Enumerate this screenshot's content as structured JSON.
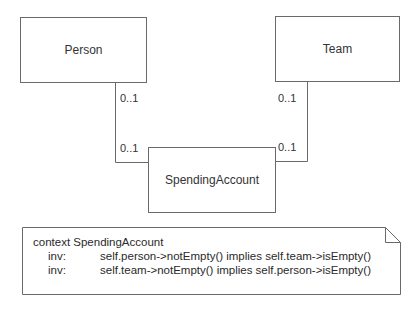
{
  "diagram": {
    "type": "UML class diagram with OCL constraint note",
    "classes": [
      {
        "id": "person",
        "name": "Person"
      },
      {
        "id": "team",
        "name": "Team"
      },
      {
        "id": "spending_account",
        "name": "SpendingAccount"
      }
    ],
    "associations": [
      {
        "from": "Person",
        "to": "SpendingAccount",
        "multiplicity_near_from": "0..1",
        "multiplicity_near_to": "0..1"
      },
      {
        "from": "Team",
        "to": "SpendingAccount",
        "multiplicity_near_from": "0..1",
        "multiplicity_near_to": "0..1"
      }
    ],
    "note": {
      "context_line": "context SpendingAccount",
      "invariants": [
        {
          "keyword": "inv:",
          "expression": "self.person->notEmpty() implies self.team->isEmpty()"
        },
        {
          "keyword": "inv:",
          "expression": "self.team->notEmpty() implies self.person->isEmpty()"
        }
      ]
    },
    "colors": {
      "line": "#6a6a6a",
      "text": "#2a2a2a",
      "background": "#ffffff"
    }
  }
}
